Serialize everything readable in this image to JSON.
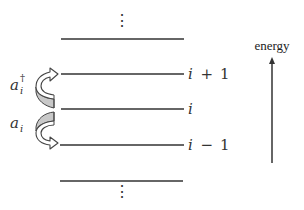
{
  "diagram": {
    "levels": [
      {
        "id": "above",
        "label": ""
      },
      {
        "id": "i_plus_1",
        "label_var": "i",
        "label_op": "+",
        "label_num": "1"
      },
      {
        "id": "i",
        "label_var": "i",
        "label_op": "",
        "label_num": ""
      },
      {
        "id": "i_minus_1",
        "label_var": "i",
        "label_op": "−",
        "label_num": "1"
      },
      {
        "id": "below",
        "label": ""
      }
    ],
    "ellipsis_top": "⋮",
    "ellipsis_bottom": "⋮",
    "raising_operator": {
      "base": "a",
      "subscript": "i",
      "superscript": "†",
      "direction": "up",
      "from": "i",
      "to": "i+1"
    },
    "lowering_operator": {
      "base": "a",
      "subscript": "i",
      "direction": "down",
      "from": "i",
      "to": "i-1"
    },
    "axis": {
      "label": "energy",
      "direction": "up"
    },
    "colors": {
      "line": "#333333",
      "arrow_fill": "#cccccc",
      "arrow_stroke": "#444444",
      "background": "#ffffff"
    }
  }
}
